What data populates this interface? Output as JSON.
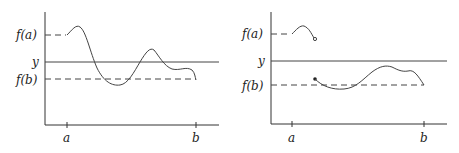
{
  "panels": [
    {
      "id": "continuous",
      "labels": {
        "fa": "f(a)",
        "y": "y",
        "fb": "f(b)",
        "a": "a",
        "b": "b"
      }
    },
    {
      "id": "discontinuous",
      "labels": {
        "fa": "f(a)",
        "y": "y",
        "fb": "f(b)",
        "a": "a",
        "b": "b"
      }
    }
  ]
}
